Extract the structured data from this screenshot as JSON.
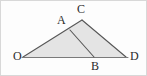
{
  "figure": {
    "canvas": {
      "width": 147,
      "height": 76
    },
    "border_color": "#d8d8d8",
    "background_color": "#fdfdfd",
    "stroke_color": "#555555",
    "fill_color": "#e2e2e2",
    "baseline_color": "#777777",
    "points": [
      {
        "name": "O",
        "label": "O",
        "x": 23,
        "y": 57,
        "label_x": 13,
        "label_y": 50
      },
      {
        "name": "A",
        "label": "A",
        "x": 70,
        "y": 30,
        "label_x": 57,
        "label_y": 14
      },
      {
        "name": "C",
        "label": "C",
        "x": 82,
        "y": 20,
        "label_x": 77,
        "label_y": 3
      },
      {
        "name": "B",
        "label": "B",
        "x": 94,
        "y": 57,
        "label_x": 91,
        "label_y": 60
      },
      {
        "name": "D",
        "label": "D",
        "x": 126,
        "y": 57,
        "label_x": 130,
        "label_y": 50
      }
    ],
    "segments": [
      {
        "name": "OC",
        "from": "O",
        "to": "C"
      },
      {
        "name": "CD",
        "from": "C",
        "to": "D"
      },
      {
        "name": "OD",
        "from": "O",
        "to": "D"
      },
      {
        "name": "AB",
        "from": "A",
        "to": "B"
      }
    ],
    "shaded_region": "O-C-D",
    "polygon_points": "23,57 82,20 126,57"
  }
}
